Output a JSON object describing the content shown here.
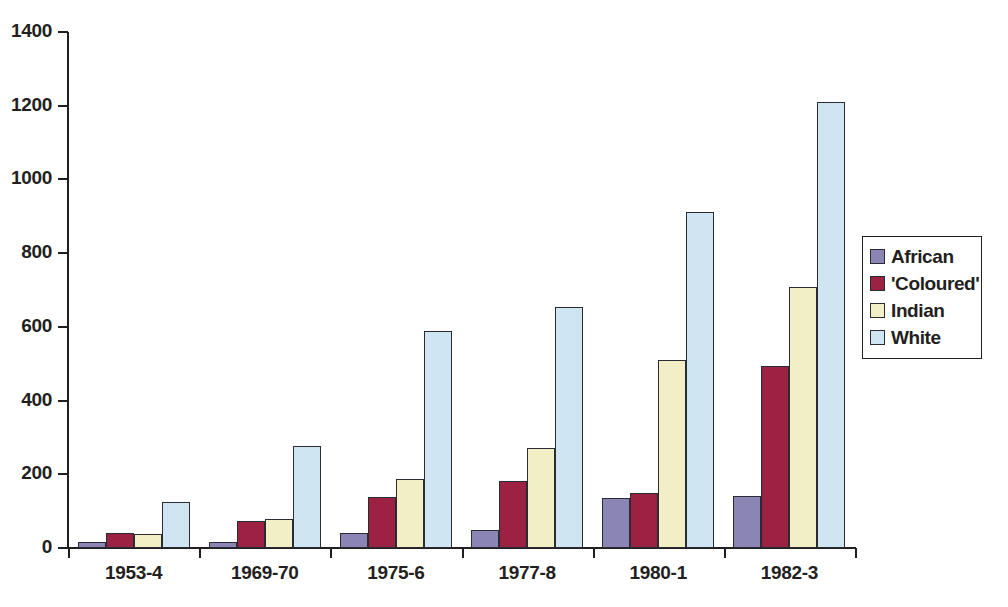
{
  "chart_data": {
    "type": "bar",
    "title": "",
    "subtitle": "",
    "xlabel": "",
    "ylabel": "",
    "ylim": [
      0,
      1400
    ],
    "yticks": [
      0,
      200,
      400,
      600,
      800,
      1000,
      1200,
      1400
    ],
    "ytick_labels": [
      "0",
      "200",
      "400",
      "600",
      "800",
      "1000",
      "1200",
      "1400"
    ],
    "grid": false,
    "legend_position": "right",
    "categories": [
      "1953-4",
      "1969-70",
      "1975-6",
      "1977-8",
      "1980-1",
      "1982-3"
    ],
    "series": [
      {
        "name": "African",
        "color": "#8b85b6",
        "values": [
          15,
          17,
          40,
          50,
          135,
          141
        ]
      },
      {
        "name": "'Coloured'",
        "color": "#9b2242",
        "values": [
          40,
          72,
          138,
          182,
          150,
          494
        ]
      },
      {
        "name": "Indian",
        "color": "#f2efc6",
        "values": [
          38,
          80,
          187,
          271,
          510,
          707
        ]
      },
      {
        "name": "White",
        "color": "#cfe5f2",
        "values": [
          126,
          277,
          589,
          653,
          911,
          1209
        ]
      }
    ]
  },
  "legend": {
    "entries": [
      {
        "label": "African",
        "swatch": "#8b85b6"
      },
      {
        "label": "'Coloured'",
        "swatch": "#9b2242"
      },
      {
        "label": "Indian",
        "swatch": "#f2efc6"
      },
      {
        "label": "White",
        "swatch": "#cfe5f2"
      }
    ]
  },
  "style": {
    "axis_color": "#231f20",
    "bar_border_color": "#2b2b33",
    "background": "#ffffff"
  }
}
